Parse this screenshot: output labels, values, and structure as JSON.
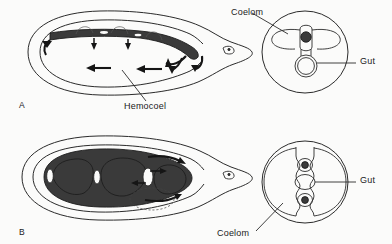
{
  "figure": {
    "background_color": "#fbfbfa",
    "ink_color": "#1a1a1a",
    "organ_fill_color": "#3a3a3a"
  },
  "panels": [
    {
      "letter": "A",
      "description": "Animal with open circulatory system: body cavity is a hemocoel; gut suspended within, blood flows freely",
      "views": {
        "lateral": {
          "name": "lateral-view-a",
          "organ_name": "gut-tube",
          "flow_arrows": 8,
          "head_orientation": "right"
        },
        "cross_section": {
          "name": "cross-section-a",
          "structures": [
            "coelom",
            "gut"
          ],
          "filled_circles": 1,
          "open_circles": 1
        }
      },
      "labels": [
        {
          "name": "coelom-label-a",
          "text": "Coelom"
        },
        {
          "name": "gut-label-a",
          "text": "Gut"
        },
        {
          "name": "hemocoel-label-a",
          "text": "Hemocoel"
        }
      ]
    },
    {
      "letter": "B",
      "description": "Segmented animal with true coelom: fluid-filled compartments separated by septa, gut running through center",
      "views": {
        "lateral": {
          "name": "lateral-view-b",
          "organ_name": "coelomic-compartments",
          "segments": 4,
          "flow_arrows": 4,
          "head_orientation": "right"
        },
        "cross_section": {
          "name": "cross-section-b",
          "structures": [
            "coelom",
            "gut"
          ],
          "filled_circles": 2,
          "open_circles": 1
        }
      },
      "labels": [
        {
          "name": "gut-label-b",
          "text": "Gut"
        },
        {
          "name": "coelom-label-b",
          "text": "Coelom"
        }
      ]
    }
  ],
  "labels": {
    "coelom_a": "Coelom",
    "gut_a": "Gut",
    "hemocoel": "Hemocoel",
    "gut_b": "Gut",
    "coelom_b": "Coelom",
    "panel_a": "A",
    "panel_b": "B"
  }
}
